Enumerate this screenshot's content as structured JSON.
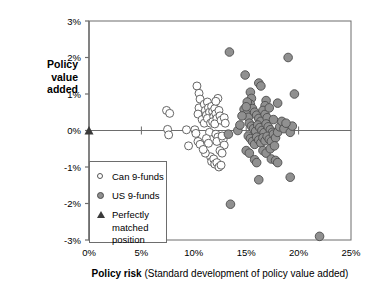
{
  "chart_data": {
    "type": "scatter",
    "title": "",
    "xlabel": "Policy risk (Standard development of policy value added)",
    "xlabel_bold_part": "Policy risk",
    "xlabel_rest": " (Standard development of policy value added)",
    "ylabel": "Policy value added",
    "ylabel_lines": [
      "Policy",
      "value",
      "added"
    ],
    "xlim": [
      0,
      25
    ],
    "ylim": [
      -3,
      3
    ],
    "x_ticks": [
      0,
      5,
      10,
      15,
      20,
      25
    ],
    "x_tick_labels": [
      "0%",
      "5%",
      "10%",
      "15%",
      "20%",
      "25%"
    ],
    "y_ticks": [
      -3,
      -2,
      -1,
      0,
      1,
      2,
      3
    ],
    "y_tick_labels": [
      "-3%",
      "-2%",
      "-1%",
      "0%",
      "1%",
      "2%",
      "3%"
    ],
    "grid": false,
    "zero_line": true,
    "legend_position": "lower-left-inside",
    "colors": {
      "can_marker_fill": "#ffffff",
      "can_marker_stroke": "#555555",
      "us_marker_fill": "#909090",
      "us_marker_stroke": "#4d4d4d",
      "triangle": "#3a3a3a",
      "axis": "#6d6d6d",
      "text": "#000000"
    },
    "series": [
      {
        "name": "Can 9-funds",
        "marker": "open-circle",
        "points": [
          [
            7.4,
            0.55
          ],
          [
            7.7,
            0.47
          ],
          [
            7.5,
            0.03
          ],
          [
            7.6,
            -0.12
          ],
          [
            9.3,
            0.02
          ],
          [
            9.5,
            -0.42
          ],
          [
            10.1,
            0.02
          ],
          [
            10.2,
            -0.08
          ],
          [
            10.4,
            -0.3
          ],
          [
            10.6,
            -0.38
          ],
          [
            10.3,
            1.22
          ],
          [
            10.5,
            1.02
          ],
          [
            10.6,
            0.86
          ],
          [
            10.5,
            0.62
          ],
          [
            10.4,
            0.45
          ],
          [
            10.8,
            0.3
          ],
          [
            11.0,
            0.72
          ],
          [
            11.1,
            0.55
          ],
          [
            11.2,
            0.42
          ],
          [
            11.0,
            0.2
          ],
          [
            11.3,
            0.78
          ],
          [
            11.4,
            0.62
          ],
          [
            11.5,
            0.5
          ],
          [
            11.3,
            0.33
          ],
          [
            11.6,
            0.2
          ],
          [
            11.5,
            -0.05
          ],
          [
            11.2,
            -0.22
          ],
          [
            11.4,
            -0.35
          ],
          [
            11.7,
            0.66
          ],
          [
            11.8,
            0.52
          ],
          [
            11.9,
            0.38
          ],
          [
            11.8,
            0.24
          ],
          [
            12.0,
            0.6
          ],
          [
            12.1,
            0.46
          ],
          [
            12.2,
            0.33
          ],
          [
            12.0,
            0.18
          ],
          [
            12.1,
            -0.1
          ],
          [
            12.3,
            -0.18
          ],
          [
            12.2,
            -0.3
          ],
          [
            12.4,
            0.55
          ],
          [
            12.5,
            0.4
          ],
          [
            12.6,
            0.28
          ],
          [
            12.3,
            0.88
          ],
          [
            12.1,
            0.8
          ],
          [
            11.6,
            -0.72
          ],
          [
            11.7,
            -0.85
          ],
          [
            11.9,
            -0.78
          ],
          [
            12.0,
            -0.92
          ],
          [
            12.2,
            -0.88
          ],
          [
            12.4,
            -1.0
          ],
          [
            12.6,
            -0.95
          ],
          [
            12.8,
            -0.25
          ],
          [
            12.7,
            -0.15
          ],
          [
            12.9,
            0.35
          ],
          [
            13.0,
            0.2
          ],
          [
            12.9,
            -0.4
          ],
          [
            11.1,
            -0.62
          ],
          [
            10.9,
            -0.52
          ],
          [
            12.5,
            -0.55
          ],
          [
            12.7,
            -0.62
          ]
        ]
      },
      {
        "name": "US 9-funds",
        "marker": "filled-circle",
        "points": [
          [
            13.4,
            2.15
          ],
          [
            19.0,
            2.0
          ],
          [
            14.9,
            1.52
          ],
          [
            16.2,
            1.3
          ],
          [
            16.4,
            1.22
          ],
          [
            15.4,
            1.05
          ],
          [
            19.6,
            1.0
          ],
          [
            15.5,
            0.88
          ],
          [
            15.4,
            0.72
          ],
          [
            16.9,
            0.82
          ],
          [
            16.8,
            0.68
          ],
          [
            18.0,
            0.75
          ],
          [
            14.8,
            0.58
          ],
          [
            15.0,
            0.45
          ],
          [
            15.2,
            0.36
          ],
          [
            14.6,
            0.4
          ],
          [
            15.6,
            0.6
          ],
          [
            15.8,
            0.5
          ],
          [
            16.0,
            0.42
          ],
          [
            16.2,
            0.33
          ],
          [
            16.4,
            0.25
          ],
          [
            16.6,
            0.55
          ],
          [
            16.8,
            0.44
          ],
          [
            17.0,
            0.35
          ],
          [
            15.3,
            0.2
          ],
          [
            15.5,
            0.12
          ],
          [
            15.7,
            0.05
          ],
          [
            15.9,
            -0.02
          ],
          [
            16.1,
            0.15
          ],
          [
            16.3,
            0.08
          ],
          [
            16.5,
            0.0
          ],
          [
            16.7,
            -0.06
          ],
          [
            16.9,
            0.18
          ],
          [
            17.1,
            0.1
          ],
          [
            17.3,
            0.02
          ],
          [
            17.5,
            -0.05
          ],
          [
            15.2,
            -0.15
          ],
          [
            15.4,
            -0.22
          ],
          [
            15.6,
            -0.3
          ],
          [
            15.8,
            -0.38
          ],
          [
            16.0,
            -0.18
          ],
          [
            16.2,
            -0.26
          ],
          [
            16.4,
            -0.34
          ],
          [
            16.6,
            -0.2
          ],
          [
            16.8,
            -0.28
          ],
          [
            17.0,
            -0.16
          ],
          [
            17.2,
            -0.24
          ],
          [
            17.4,
            -0.3
          ],
          [
            17.6,
            -0.1
          ],
          [
            17.8,
            -0.2
          ],
          [
            18.0,
            -0.05
          ],
          [
            18.2,
            0.1
          ],
          [
            18.4,
            0.25
          ],
          [
            18.6,
            0.05
          ],
          [
            19.2,
            -0.05
          ],
          [
            19.4,
            0.12
          ],
          [
            13.3,
            -0.1
          ],
          [
            14.2,
            0.0
          ],
          [
            15.0,
            -0.55
          ],
          [
            15.3,
            -0.62
          ],
          [
            16.6,
            -0.55
          ],
          [
            16.9,
            -0.62
          ],
          [
            17.3,
            -0.5
          ],
          [
            17.7,
            -0.42
          ],
          [
            15.8,
            -0.8
          ],
          [
            16.0,
            -0.88
          ],
          [
            17.4,
            -0.78
          ],
          [
            17.8,
            -0.82
          ],
          [
            18.0,
            -0.88
          ],
          [
            16.2,
            -1.35
          ],
          [
            19.2,
            -1.28
          ],
          [
            13.5,
            -2.02
          ],
          [
            22.0,
            -2.9
          ],
          [
            15.1,
            0.78
          ],
          [
            15.0,
            0.65
          ],
          [
            17.2,
            0.62
          ],
          [
            17.6,
            0.3
          ],
          [
            14.4,
            0.15
          ],
          [
            18.8,
            0.2
          ]
        ]
      },
      {
        "name": "Perfectly matched position",
        "marker": "triangle",
        "points": [
          [
            0,
            0
          ]
        ]
      }
    ],
    "legend": [
      {
        "label": "Can 9-funds",
        "marker": "open-circle"
      },
      {
        "label": "US 9-funds",
        "marker": "filled-circle"
      },
      {
        "label": "Perfectly",
        "label_line2": "matched",
        "label_line3": "position",
        "marker": "triangle"
      }
    ]
  }
}
